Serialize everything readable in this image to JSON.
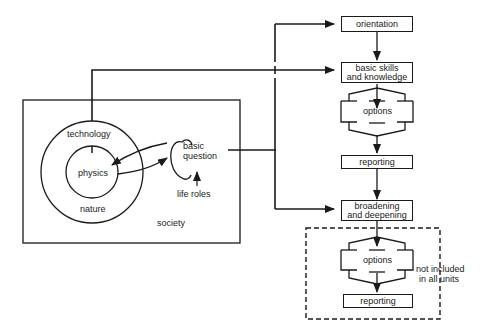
{
  "diagram": {
    "left_panel": {
      "outer_label": "society",
      "outer_circle_label": "technology",
      "middle_ring_label": "nature",
      "inner_circle_label": "physics",
      "loop_label": "basic question",
      "loop_label_line1": "basic",
      "loop_label_line2": "question",
      "input_label": "life roles"
    },
    "flow": {
      "steps": [
        {
          "id": "orientation",
          "label": "orientation"
        },
        {
          "id": "basic-skills",
          "label_line1": "basic skills",
          "label_line2": "and knowledge"
        },
        {
          "id": "options-1",
          "label": "options"
        },
        {
          "id": "reporting-1",
          "label": "reporting"
        },
        {
          "id": "broadening",
          "label_line1": "broadening",
          "label_line2": "and deepening"
        },
        {
          "id": "options-2",
          "label": "options"
        },
        {
          "id": "reporting-2",
          "label": "reporting"
        }
      ],
      "optional_group_note_line1": "not included",
      "optional_group_note_line2": "in all units"
    },
    "colors": {
      "line": "#1a1a1a",
      "background": "#ffffff"
    }
  }
}
